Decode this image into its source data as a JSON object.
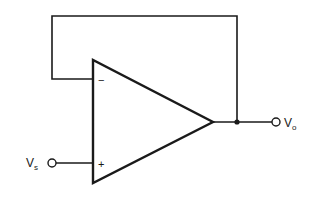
{
  "diagram": {
    "type": "op-amp voltage follower circuit",
    "components": {
      "op_amp": {
        "inverting_input_sign": "−",
        "non_inverting_input_sign": "+"
      },
      "input_terminal": {
        "label_main": "V",
        "label_sub": "s"
      },
      "output_terminal": {
        "label_main": "V",
        "label_sub": "o"
      },
      "feedback": "output connected directly to inverting input"
    },
    "colors": {
      "line": "#1a1a1a",
      "background": "#ffffff"
    }
  }
}
